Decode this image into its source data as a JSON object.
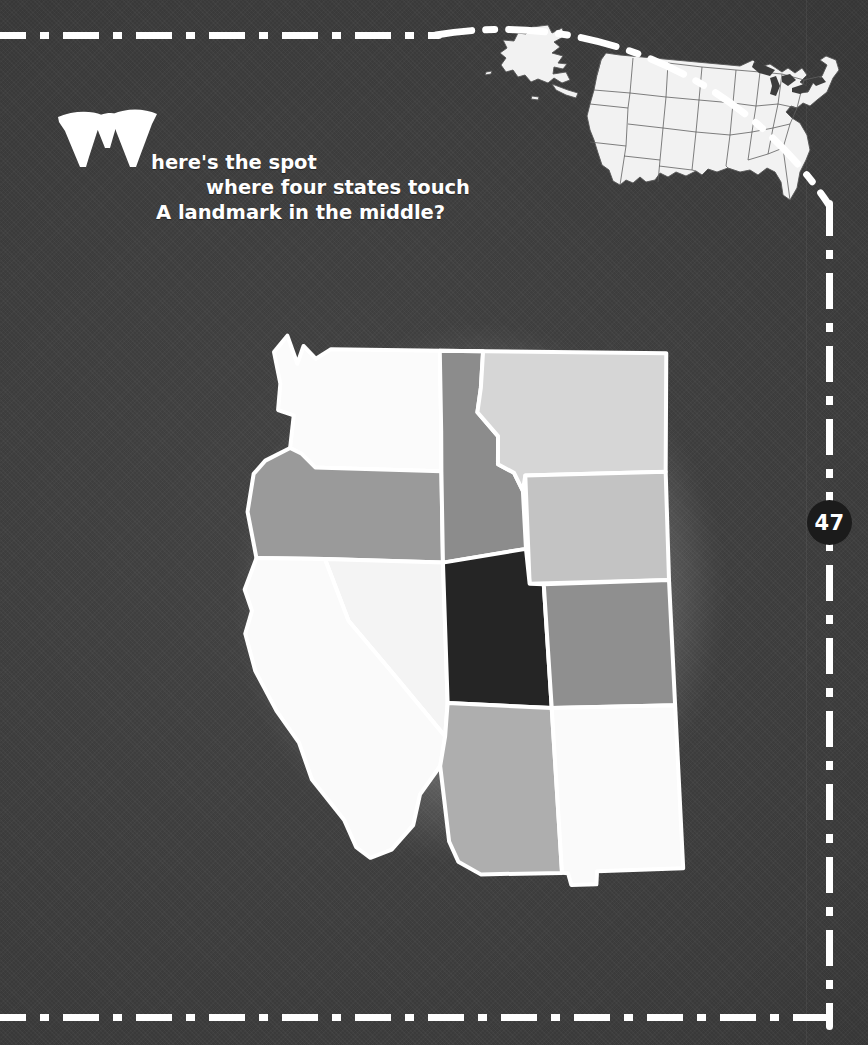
{
  "page": {
    "number": "47",
    "background_color": "#3c3c3c",
    "rule_color": "#ffffff",
    "badge_color": "#1b1b1b"
  },
  "headline": {
    "dropcap": "W",
    "line1": "here's the spot",
    "line2": "where four states touch",
    "line3": "A landmark in the middle?",
    "full_text": "Where's the spot where four states touch A landmark in the middle?",
    "text_color": "#ffffff"
  },
  "inset_map": {
    "name": "united-states-locator-map",
    "fill": "#f2f2f2",
    "stroke": "#555555",
    "includes": [
      "contiguous-united-states",
      "alaska",
      "hawaii"
    ]
  },
  "main_map": {
    "name": "western-united-states-map",
    "region": "Western United States",
    "highlight_note": "Utah shaded darkest; Four Corners point where Utah, Colorado, Arizona and New Mexico meet",
    "border_color": "#ffffff",
    "states": [
      {
        "code": "WA",
        "name": "Washington",
        "fill": "#fbfbfb"
      },
      {
        "code": "OR",
        "name": "Oregon",
        "fill": "#9a9a9a"
      },
      {
        "code": "ID",
        "name": "Idaho",
        "fill": "#8c8c8c"
      },
      {
        "code": "MT",
        "name": "Montana",
        "fill": "#d6d6d6"
      },
      {
        "code": "WY",
        "name": "Wyoming",
        "fill": "#c3c3c3"
      },
      {
        "code": "CA",
        "name": "California",
        "fill": "#fafafa"
      },
      {
        "code": "NV",
        "name": "Nevada",
        "fill": "#f4f4f4"
      },
      {
        "code": "UT",
        "name": "Utah",
        "fill": "#252525"
      },
      {
        "code": "CO",
        "name": "Colorado",
        "fill": "#8f8f8f"
      },
      {
        "code": "AZ",
        "name": "Arizona",
        "fill": "#aeaeae"
      },
      {
        "code": "NM",
        "name": "New Mexico",
        "fill": "#fafafa"
      }
    ]
  }
}
